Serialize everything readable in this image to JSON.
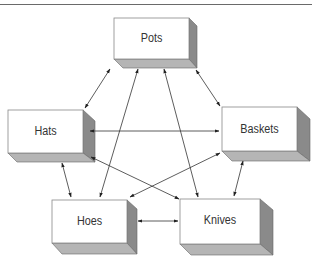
{
  "header": {
    "caption_fragment": "...diagram of a p..."
  },
  "diagram": {
    "type": "network",
    "nodes": [
      {
        "id": "pots",
        "label": "Pots",
        "x": 114,
        "y": 18,
        "w": 75,
        "h": 41
      },
      {
        "id": "hats",
        "label": "Hats",
        "x": 8,
        "y": 110,
        "w": 75,
        "h": 43
      },
      {
        "id": "baskets",
        "label": "Baskets",
        "x": 222,
        "y": 107,
        "w": 75,
        "h": 44
      },
      {
        "id": "hoes",
        "label": "Hoes",
        "x": 52,
        "y": 200,
        "w": 75,
        "h": 43
      },
      {
        "id": "knives",
        "label": "Knives",
        "x": 180,
        "y": 199,
        "w": 80,
        "h": 45
      }
    ],
    "edges": [
      {
        "from": "pots",
        "to": "hats",
        "bidirectional": true
      },
      {
        "from": "pots",
        "to": "baskets",
        "bidirectional": true
      },
      {
        "from": "pots",
        "to": "hoes",
        "bidirectional": true
      },
      {
        "from": "pots",
        "to": "knives",
        "bidirectional": true
      },
      {
        "from": "hats",
        "to": "baskets",
        "bidirectional": true
      },
      {
        "from": "hats",
        "to": "hoes",
        "bidirectional": true
      },
      {
        "from": "hats",
        "to": "knives",
        "bidirectional": true
      },
      {
        "from": "baskets",
        "to": "hoes",
        "bidirectional": true
      },
      {
        "from": "baskets",
        "to": "knives",
        "bidirectional": true
      },
      {
        "from": "hoes",
        "to": "knives",
        "bidirectional": true
      }
    ]
  }
}
